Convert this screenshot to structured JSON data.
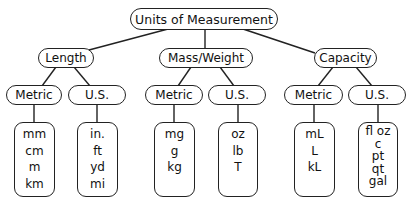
{
  "diagram": {
    "title": "Units of Measurement",
    "categories": [
      {
        "label": "Length",
        "systems": [
          {
            "label": "Metric",
            "units": [
              "mm",
              "cm",
              "m",
              "km"
            ]
          },
          {
            "label": "U.S.",
            "units": [
              "in.",
              "ft",
              "yd",
              "mi"
            ]
          }
        ]
      },
      {
        "label": "Mass/Weight",
        "systems": [
          {
            "label": "Metric",
            "units": [
              "mg",
              "g",
              "kg"
            ]
          },
          {
            "label": "U.S.",
            "units": [
              "oz",
              "lb",
              "T"
            ]
          }
        ]
      },
      {
        "label": "Capacity",
        "systems": [
          {
            "label": "Metric",
            "units": [
              "mL",
              "L",
              "kL"
            ]
          },
          {
            "label": "U.S.",
            "units": [
              "fl oz",
              "c",
              "pt",
              "qt",
              "gal"
            ]
          }
        ]
      }
    ]
  }
}
